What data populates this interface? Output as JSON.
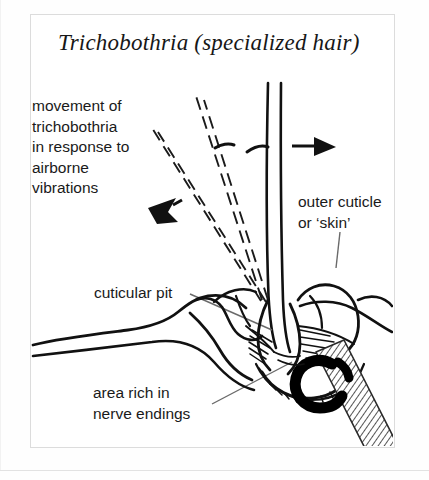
{
  "figure": {
    "title": "Trichobothria (specialized hair)",
    "frame_color": "#dcdcdc",
    "ink_color": "#111111",
    "background": "#ffffff"
  },
  "labels": {
    "movement": "movement of\ntrichobothria\nin response to\nairborne\nvibrations",
    "outer_cuticle": "outer cuticle\nor ‘skin’",
    "cuticular_pit": "cuticular pit",
    "nerve_endings": "area rich in\nnerve endings"
  },
  "annotations": {
    "arrow_right_name": "movement-arrow-right",
    "arrow_left_name": "movement-arrow-left",
    "dashed_hair_positions": 2,
    "leader_lines": 3
  }
}
